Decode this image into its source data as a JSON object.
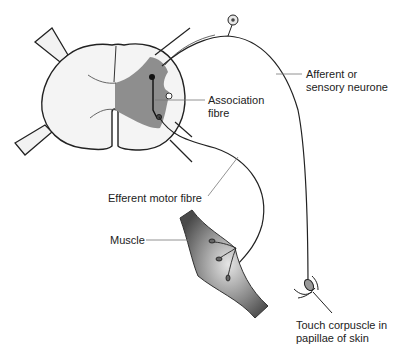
{
  "diagram": {
    "labels": {
      "afferent_line1": "Afferent or",
      "afferent_line2": "sensory neurone",
      "association_line1": "Association",
      "association_line2": "fibre",
      "efferent": "Efferent motor fibre",
      "muscle": "Muscle",
      "touch_line1": "Touch corpuscle in",
      "touch_line2": "papillae of skin"
    },
    "colors": {
      "outline": "#222222",
      "grey_matter_left": "#f0f0f0",
      "grey_matter_shaded": "#8e8e8e",
      "cord_fill": "#f4f4f4",
      "muscle_dark": "#5a5a5a",
      "muscle_light": "#dcdcdc"
    }
  }
}
